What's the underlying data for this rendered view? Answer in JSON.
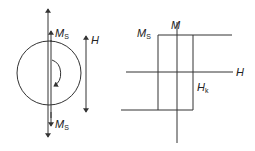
{
  "diagram": {
    "left": {
      "title": "single-domain particle with magnetization reversal",
      "labels": {
        "ms_top": {
          "main": "M",
          "sub": "S"
        },
        "ms_bottom": {
          "main": "M",
          "sub": "S"
        },
        "field": "H"
      }
    },
    "right": {
      "title": "square hysteresis loop",
      "labels": {
        "ms": {
          "main": "M",
          "sub": "S"
        },
        "m_axis": "M",
        "h_axis": "H",
        "hk": {
          "main": "H",
          "sub": "k"
        }
      }
    },
    "colors": {
      "line": "#333333",
      "text": "#222222",
      "background": "#ffffff"
    }
  }
}
